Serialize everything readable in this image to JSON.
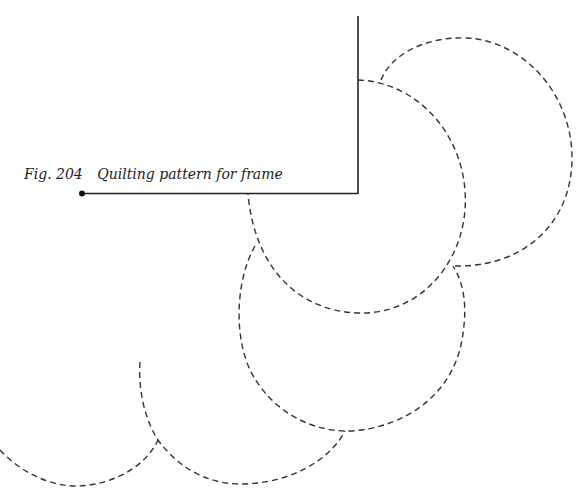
{
  "caption": {
    "figure_label": "Fig. 204",
    "title": "Quilting pattern for frame"
  },
  "colors": {
    "line": "#222222",
    "dash": "#333333",
    "background": "#ffffff"
  }
}
